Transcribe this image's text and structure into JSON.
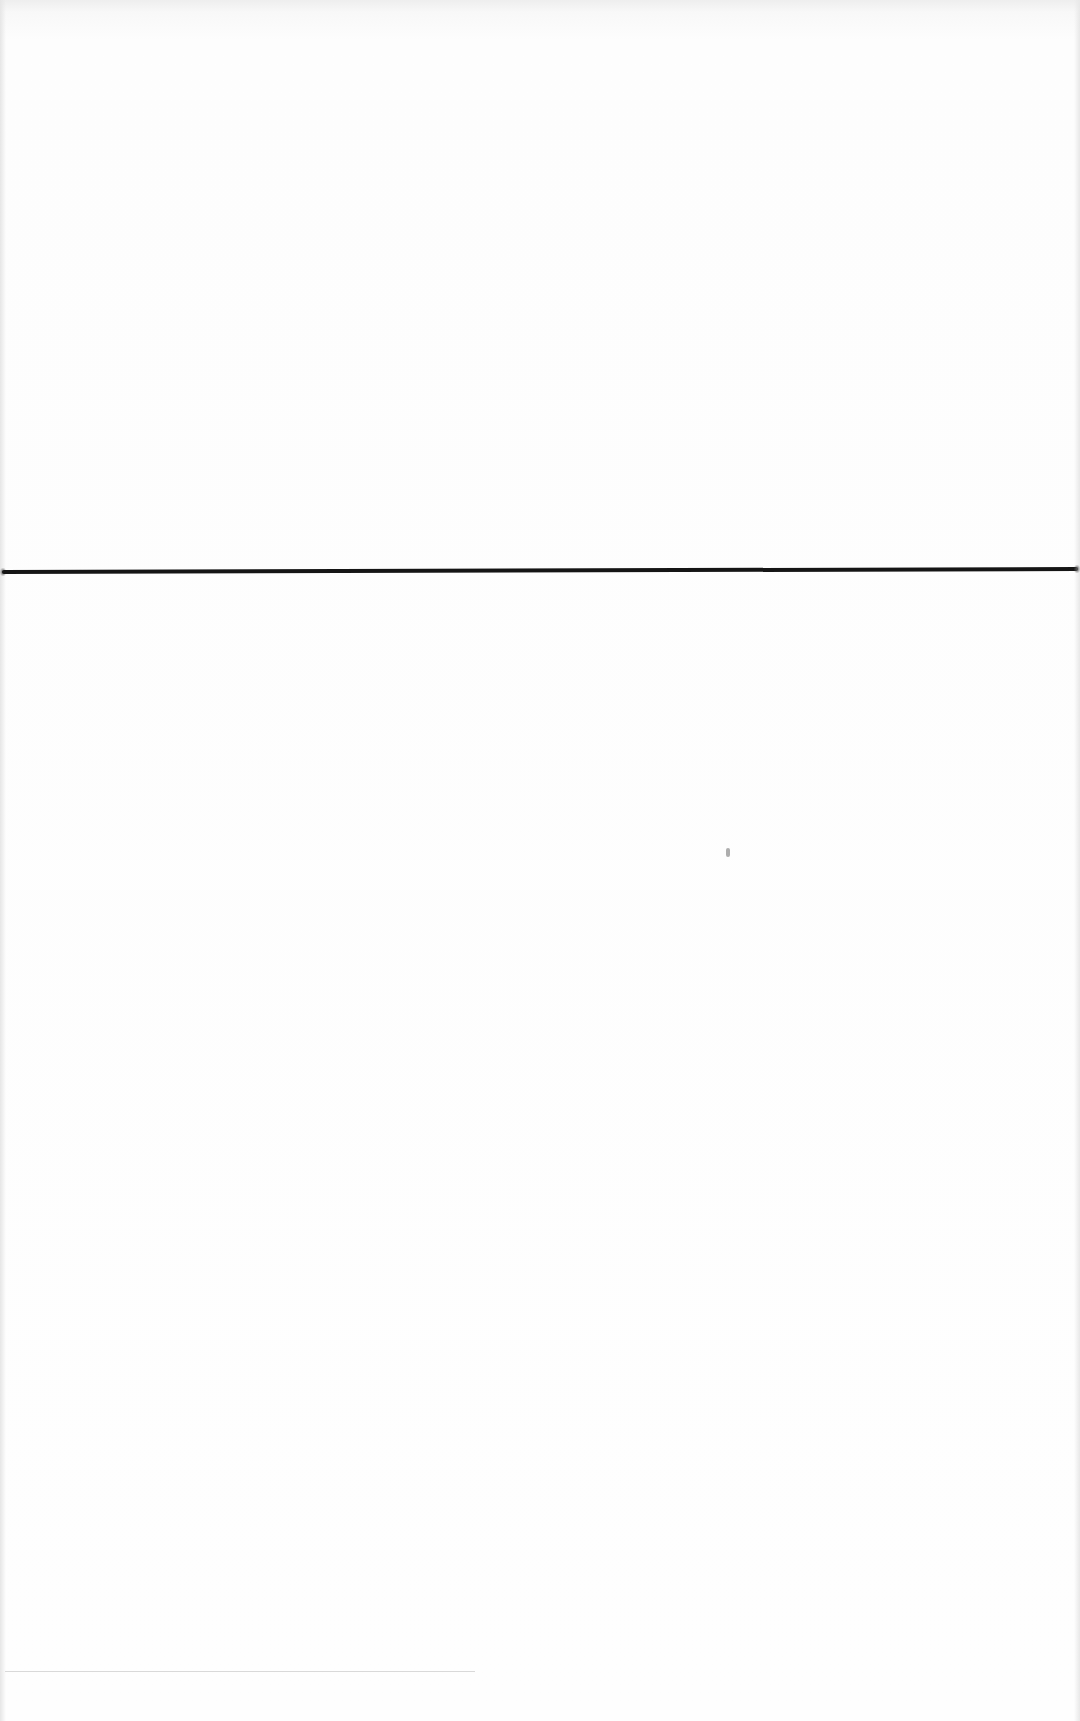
{
  "document": {
    "type": "scanned-blank-page",
    "background_color": "#fdfdfd",
    "text_content": "",
    "rule": {
      "orientation": "horizontal",
      "color": "#151515",
      "y_left": 575,
      "y_right": 572,
      "thickness": 4
    },
    "artifacts": {
      "speck": {
        "x": 728,
        "y": 853
      },
      "faint_bottom_line": {
        "x_start": 5,
        "x_end": 475,
        "y": 1672,
        "color": "#d9d9d9"
      }
    }
  }
}
